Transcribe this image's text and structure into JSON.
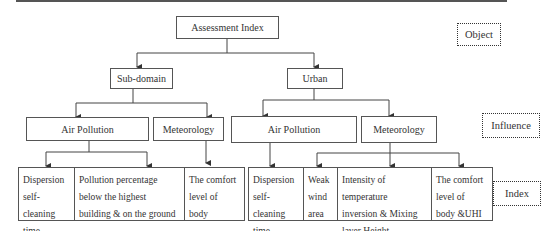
{
  "diagram": {
    "root": {
      "label": "Assessment Index"
    },
    "level1": [
      {
        "label": "Sub-domain"
      },
      {
        "label": "Urban"
      }
    ],
    "level2": {
      "subdomain": [
        {
          "label": "Air Pollution"
        },
        {
          "label": "Meteorology"
        }
      ],
      "urban": [
        {
          "label": "Air Pollution"
        },
        {
          "label": "Meteorology"
        }
      ]
    },
    "level3": {
      "subdomain": [
        {
          "label": "Dispersion\nself-cleaning\ntime"
        },
        {
          "label": "Pollution percentage\nbelow the highest\nbuilding & on the ground"
        },
        {
          "label": "The comfort\nlevel of\nbody"
        }
      ],
      "urban": [
        {
          "label": "Dispersion\nself-cleaning\ntime"
        },
        {
          "label": "Weak\nwind\narea"
        },
        {
          "label": "Intensity of temperature\ninversion & Mixing\nlayer Height"
        },
        {
          "label": "The comfort\nlevel of\nbody &UHI"
        }
      ]
    },
    "legend": [
      {
        "label": "Object"
      },
      {
        "label": "Influence"
      },
      {
        "label": "Index"
      }
    ]
  }
}
